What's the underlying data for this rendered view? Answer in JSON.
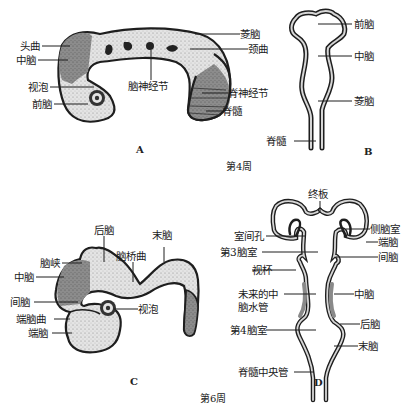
{
  "figure": {
    "panels": [
      {
        "id": "A",
        "letter": "A",
        "description": "Lateral view of embryonic brain at week 4",
        "labels": {
          "cephalic_flexure": "头曲",
          "midbrain": "中脑",
          "optic_vesicle": "视泡",
          "forebrain": "前脑",
          "cranial_ganglia": "脑神经节",
          "hindbrain": "菱脑",
          "cervical_flexure": "颈曲",
          "spinal_ganglia": "脊神经节",
          "spinal_cord": "脊髓"
        }
      },
      {
        "id": "B",
        "letter": "B",
        "description": "Frontal section of neural tube at week 4",
        "labels": {
          "forebrain": "前脑",
          "midbrain": "中脑",
          "hindbrain": "菱脑",
          "spinal_cord": "脊髓"
        }
      },
      {
        "id": "C",
        "letter": "C",
        "description": "Lateral view of embryonic brain at week 6",
        "labels": {
          "metencephalon": "后脑",
          "myelencephalon": "末脑",
          "isthmus": "脑峡",
          "pontine_flexure": "脑桥曲",
          "mesencephalon": "中脑",
          "diencephalon": "间脑",
          "optic_vesicle": "视泡",
          "telencephalic_flexure": "端脑曲",
          "telencephalon": "端脑"
        }
      },
      {
        "id": "D",
        "letter": "D",
        "description": "Frontal section of brain ventricles at week 6",
        "labels": {
          "lamina_terminalis": "终板",
          "interventricular_foramen": "室间孔",
          "lateral_ventricle": "侧脑室",
          "telencephalon": "端脑",
          "third_ventricle": "第3脑室",
          "diencephalon": "间脑",
          "optic_cup": "视杯",
          "future_aqueduct_line1": "未来的中",
          "future_aqueduct_line2": "脑水管",
          "mesencephalon": "中脑",
          "metencephalon": "后脑",
          "fourth_ventricle": "第4脑室",
          "myelencephalon": "末脑",
          "central_canal": "脊髓中央管"
        }
      }
    ],
    "captions": {
      "week4": "第4周",
      "week6": "第6周"
    },
    "colors": {
      "outline": "#1e1e1e",
      "light_tissue": "#e2e2e2",
      "dark_tissue": "#8a8a8a",
      "lumen_wall": "#cfcfcf",
      "background": "#ffffff"
    }
  }
}
